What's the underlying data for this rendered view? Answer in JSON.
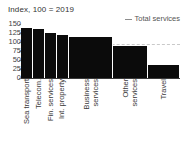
{
  "chart_data": {
    "type": "bar",
    "title": "Index, 100 = 2019",
    "xlabel": "",
    "ylabel": "",
    "ylim": [
      0,
      150
    ],
    "yticks": [
      0,
      25,
      50,
      75,
      100,
      125,
      150
    ],
    "grid": false,
    "legend_position": "top-right",
    "legend": [
      {
        "label": "Total services",
        "marker": "dashed-line",
        "color": "#8d8d8d"
      }
    ],
    "categories": [
      "Sea transport",
      "Telecom.",
      "Fin. services",
      "Int. property",
      "Business\nservices",
      "Other\nservices",
      "Travel"
    ],
    "values": [
      138,
      136,
      125,
      120,
      113,
      88,
      36
    ],
    "bar_widths": [
      11,
      11,
      10,
      11,
      40,
      31,
      29
    ],
    "bar_color": "#0b0b0b",
    "reference_line": {
      "label": "Total services",
      "value": 95,
      "style": "dashed",
      "color": "#c9c9c9"
    }
  }
}
